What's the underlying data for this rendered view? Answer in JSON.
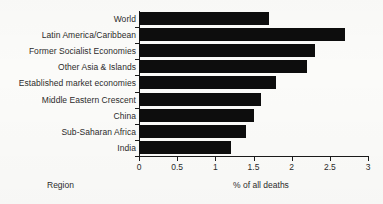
{
  "chart_data": {
    "type": "bar",
    "orientation": "horizontal",
    "title": "",
    "xlabel": "% of all deaths",
    "ylabel": "Region",
    "xlim": [
      0,
      3
    ],
    "xticks": [
      "0",
      "0.5",
      "1",
      "1.5",
      "2",
      "2.5",
      "3"
    ],
    "xtick_values": [
      0,
      0.5,
      1,
      1.5,
      2,
      2.5,
      3
    ],
    "grid": false,
    "legend": false,
    "bar_color": "#0d0d0d",
    "categories": [
      "World",
      "Latin America/Caribbean",
      "Former Socialist Economies",
      "Other Asia & Islands",
      "Established market economies",
      "Middle Eastern Crescent",
      "China",
      "Sub-Saharan Africa",
      "India"
    ],
    "values": [
      1.7,
      2.7,
      2.3,
      2.2,
      1.8,
      1.6,
      1.5,
      1.4,
      1.2
    ]
  }
}
